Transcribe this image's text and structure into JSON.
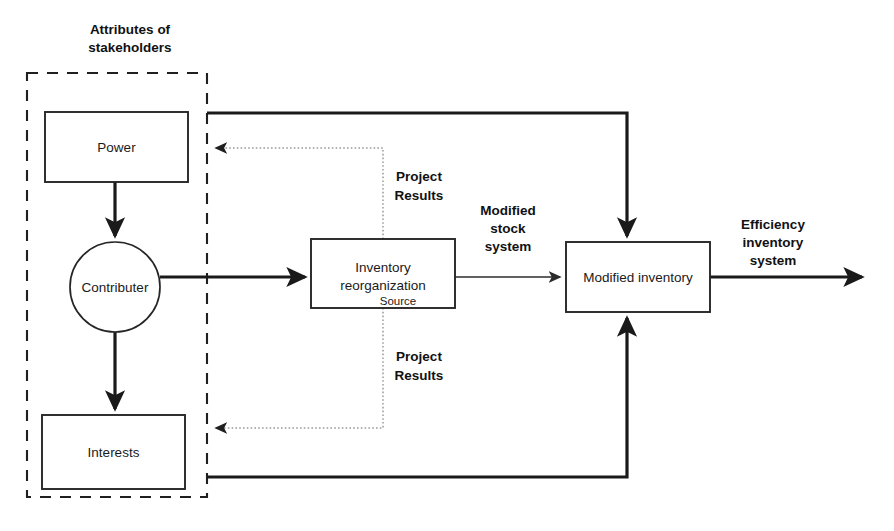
{
  "diagram": {
    "group": {
      "label_line1": "Attributes of",
      "label_line2": "stakeholders"
    },
    "nodes": {
      "power": {
        "label": "Power",
        "shape": "rectangle"
      },
      "contributer": {
        "label": "Contributer",
        "shape": "circle"
      },
      "interests": {
        "label": "Interests",
        "shape": "rectangle"
      },
      "inventory_reorganization": {
        "label_line1": "Inventory",
        "label_line2": "reorganization",
        "sublabel": "Source",
        "shape": "rectangle"
      },
      "modified_inventory": {
        "label": "Modified inventory",
        "shape": "rectangle"
      }
    },
    "edge_labels": {
      "project_results_top_line1": "Project",
      "project_results_top_line2": "Results",
      "project_results_bottom_line1": "Project",
      "project_results_bottom_line2": "Results",
      "modified_stock_line1": "Modified",
      "modified_stock_line2": "stock",
      "modified_stock_line3": "system",
      "efficiency_line1": "Efficiency",
      "efficiency_line2": "inventory",
      "efficiency_line3": "system"
    },
    "colors": {
      "background": "#ffffff",
      "stroke": "#1a1a1a",
      "dotted_stroke": "#9a9a9a",
      "text": "#111111"
    }
  }
}
